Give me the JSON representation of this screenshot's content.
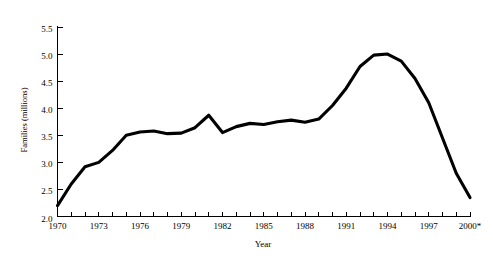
{
  "figure": {
    "clipped_header_text": "",
    "axis_color": "#000000",
    "line_color": "#000000",
    "background": "#ffffff"
  },
  "chart_data": {
    "type": "line",
    "title": "",
    "xlabel": "Year",
    "ylabel": "Families (millions)",
    "xlim": [
      1970,
      2000
    ],
    "ylim": [
      2.0,
      5.5
    ],
    "grid": false,
    "legend": null,
    "x_tick_labels": [
      "1970",
      "1973",
      "1976",
      "1979",
      "1982",
      "1985",
      "1988",
      "1991",
      "1994",
      "1997",
      "2000*"
    ],
    "x_tick_values": [
      1970,
      1973,
      1976,
      1979,
      1982,
      1985,
      1988,
      1991,
      1994,
      1997,
      2000
    ],
    "x_minor_ticks_every": 1,
    "y_tick_labels": [
      "2.0",
      "2.5",
      "3.0",
      "3.5",
      "4.0",
      "4.5",
      "5.0",
      "5.5"
    ],
    "y_tick_values": [
      2.0,
      2.5,
      3.0,
      3.5,
      4.0,
      4.5,
      5.0,
      5.5
    ],
    "footnote_marker": "*",
    "x": [
      1970,
      1971,
      1972,
      1973,
      1974,
      1975,
      1976,
      1977,
      1978,
      1979,
      1980,
      1981,
      1982,
      1983,
      1984,
      1985,
      1986,
      1987,
      1988,
      1989,
      1990,
      1991,
      1992,
      1993,
      1994,
      1995,
      1996,
      1997,
      1998,
      1999,
      2000
    ],
    "values": [
      2.2,
      2.6,
      2.92,
      3.0,
      3.22,
      3.5,
      3.56,
      3.58,
      3.53,
      3.54,
      3.64,
      3.87,
      3.55,
      3.66,
      3.72,
      3.7,
      3.75,
      3.78,
      3.74,
      3.8,
      4.05,
      4.37,
      4.77,
      4.98,
      5.0,
      4.87,
      4.55,
      4.1,
      3.45,
      2.8,
      2.35
    ],
    "series": [
      {
        "name": "Families receiving assistance",
        "values": [
          2.2,
          2.6,
          2.92,
          3.0,
          3.22,
          3.5,
          3.56,
          3.58,
          3.53,
          3.54,
          3.64,
          3.87,
          3.55,
          3.66,
          3.72,
          3.7,
          3.75,
          3.78,
          3.74,
          3.8,
          4.05,
          4.37,
          4.77,
          4.98,
          5.0,
          4.87,
          4.55,
          4.1,
          3.45,
          2.8,
          2.35
        ]
      }
    ]
  }
}
